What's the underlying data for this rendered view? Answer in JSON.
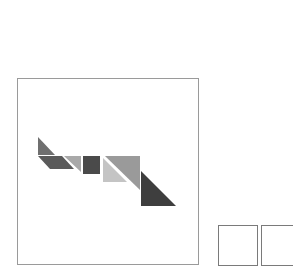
{
  "board": {
    "label": "tangram-board"
  },
  "pieces": [
    {
      "id": "small-triangle-1",
      "shape": "triangle",
      "color": "#6f6f6f",
      "points": "38,137 38,155 55,155"
    },
    {
      "id": "parallelogram",
      "shape": "parallelogram",
      "color": "#5a5a5a",
      "points": "38,156 62,156 74,169 50,169"
    },
    {
      "id": "small-triangle-2",
      "shape": "triangle",
      "color": "#a9a9a9",
      "points": "64,156 81,156 81,172"
    },
    {
      "id": "square",
      "shape": "square",
      "color": "#4a4a4a",
      "points": "83,156 100,156 100,174 83,174"
    },
    {
      "id": "medium-triangle",
      "shape": "triangle",
      "color": "#c4c4c4",
      "points": "103,158 103,182 127,182"
    },
    {
      "id": "large-triangle-1",
      "shape": "triangle",
      "color": "#9a9a9a",
      "points": "105,156 140,156 140,190"
    },
    {
      "id": "large-triangle-2",
      "shape": "triangle",
      "color": "#3e3e3e",
      "points": "141,171 141,206 176,206"
    }
  ],
  "slots": [
    {
      "id": "slot-1",
      "left": 218
    },
    {
      "id": "slot-2",
      "left": 261
    }
  ]
}
